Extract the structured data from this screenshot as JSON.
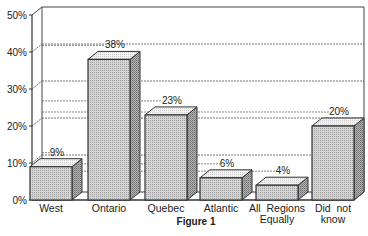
{
  "chart_data": {
    "type": "bar",
    "title": "",
    "caption": "Figure 1",
    "xlabel": "",
    "ylabel": "",
    "categories": [
      "West",
      "Ontario",
      "Quebec",
      "Atlantic",
      "All Regions Equally",
      "Did not know"
    ],
    "category_lines": [
      [
        "West"
      ],
      [
        "Ontario"
      ],
      [
        "Quebec"
      ],
      [
        "Atlantic"
      ],
      [
        "All  Regions",
        "Equally"
      ],
      [
        "Did  not",
        "know"
      ]
    ],
    "values": [
      9,
      38,
      23,
      6,
      4,
      20
    ],
    "value_labels": [
      "9%",
      "38%",
      "23%",
      "6%",
      "4%",
      "20%"
    ],
    "ylim": [
      0,
      50
    ],
    "yticks": [
      0,
      10,
      20,
      30,
      40,
      50
    ],
    "ytick_labels": [
      "0%",
      "10%",
      "20%",
      "30%",
      "40%",
      "50%"
    ],
    "grid": "dashed horizontal on back wall",
    "legend": "none",
    "style": "3D bars, stippled gray fill",
    "colors": {
      "bar_front": "#c8c8c8",
      "bar_top": "#ececec",
      "bar_side": "#9a9a9a",
      "axis": "#333333"
    }
  }
}
